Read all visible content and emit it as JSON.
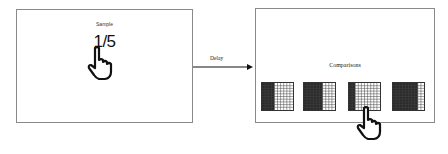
{
  "sample": {
    "title": "Sample",
    "fraction": "1/5"
  },
  "transition": {
    "label": "Delay"
  },
  "comparisons": {
    "title": "Comparisons",
    "grids": [
      {
        "columns": 10,
        "rows": 10,
        "shaded_columns": 4
      },
      {
        "columns": 10,
        "rows": 10,
        "shaded_columns": 6
      },
      {
        "columns": 10,
        "rows": 10,
        "shaded_columns": 2
      },
      {
        "columns": 10,
        "rows": 10,
        "shaded_columns": 8
      }
    ],
    "selected_index": 2
  },
  "icons": {
    "pointer": "hand-pointer-icon"
  },
  "colors": {
    "shaded": "#2b2b2b",
    "grid_line": "#444444",
    "panel_border": "#8a8a8a"
  }
}
